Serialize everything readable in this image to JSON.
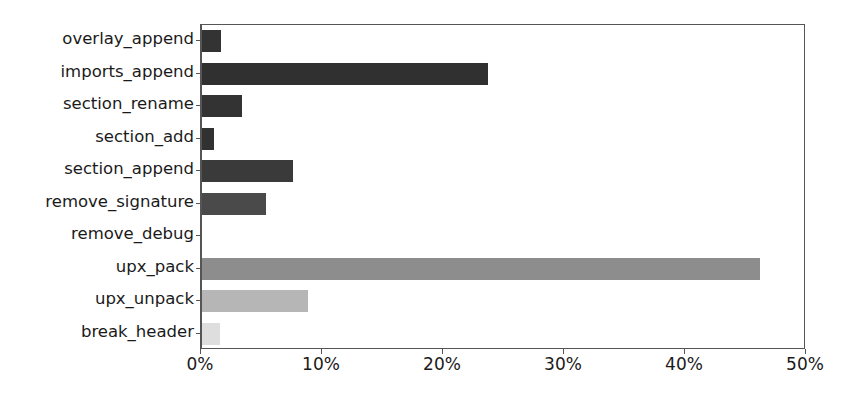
{
  "chart_data": {
    "type": "bar",
    "orientation": "horizontal",
    "title": "",
    "xlabel": "",
    "ylabel": "",
    "xlim": [
      0,
      50
    ],
    "xtick_labels": [
      "0%",
      "10%",
      "20%",
      "30%",
      "40%",
      "50%"
    ],
    "xtick_values": [
      0,
      10,
      20,
      30,
      40,
      50
    ],
    "grid": false,
    "legend": "none",
    "categories": [
      "overlay_append",
      "imports_append",
      "section_rename",
      "section_add",
      "section_append",
      "remove_signature",
      "remove_debug",
      "upx_pack",
      "upx_unpack",
      "break_header"
    ],
    "values": [
      1.6,
      23.6,
      3.3,
      1.0,
      7.5,
      5.3,
      0.0,
      46.1,
      8.8,
      1.5
    ],
    "bar_colors": [
      "#333333",
      "#303030",
      "#333333",
      "#313131",
      "#3a3a3a",
      "#4a4a4a",
      "#6f6f6f",
      "#8d8d8d",
      "#b6b6b6",
      "#dedede"
    ],
    "axis_color": "#555555",
    "text_color": "#1a1a1a",
    "background_color": "#ffffff"
  }
}
